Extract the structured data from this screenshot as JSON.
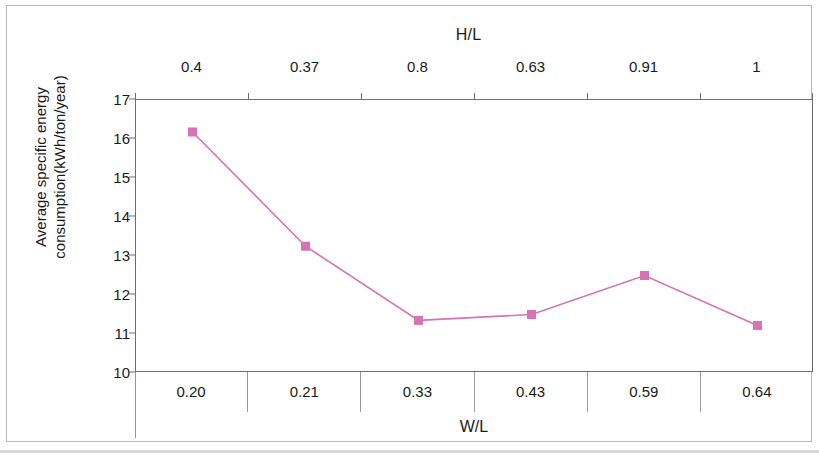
{
  "chart_data": {
    "type": "line",
    "title": "",
    "categories": [
      "0.20",
      "0.21",
      "0.33",
      "0.43",
      "0.59",
      "0.64"
    ],
    "values": [
      16.18,
      13.25,
      11.35,
      11.5,
      12.5,
      11.22
    ],
    "xlabel": "W/L",
    "ylabel": "Average specific energy consumption(kWh/ton/year)",
    "ylim": [
      10,
      17
    ],
    "yticks": [
      10,
      11,
      12,
      13,
      14,
      15,
      16,
      17
    ],
    "ytick_labels": [
      "10",
      "11",
      "12",
      "13",
      "14",
      "15",
      "16",
      "17"
    ],
    "secondary_xaxis": {
      "label": "H/L",
      "tick_labels": [
        "0.4",
        "0.37",
        "0.8",
        "0.63",
        "0.91",
        "1"
      ],
      "position": "top"
    },
    "grid": false,
    "legend": null,
    "series_color": "#d772b4",
    "marker": "square",
    "marker_color": "#d772b4"
  },
  "axes": {
    "top_title": "H/L",
    "bottom_title": "W/L",
    "left_title_line1": "Average specific energy",
    "left_title_line2": "consumption(kWh/ton/year)",
    "top_ticks": [
      "0.4",
      "0.37",
      "0.8",
      "0.63",
      "0.91",
      "1"
    ],
    "bottom_ticks": [
      "0.20",
      "0.21",
      "0.33",
      "0.43",
      "0.59",
      "0.64"
    ],
    "y_ticks": [
      "17",
      "16",
      "15",
      "14",
      "13",
      "12",
      "11",
      "10"
    ]
  },
  "colors": {
    "series": "#d772b4",
    "axis": "#6e6e6e",
    "frame": "#b9b9b9",
    "text": "#1a1a1a"
  }
}
